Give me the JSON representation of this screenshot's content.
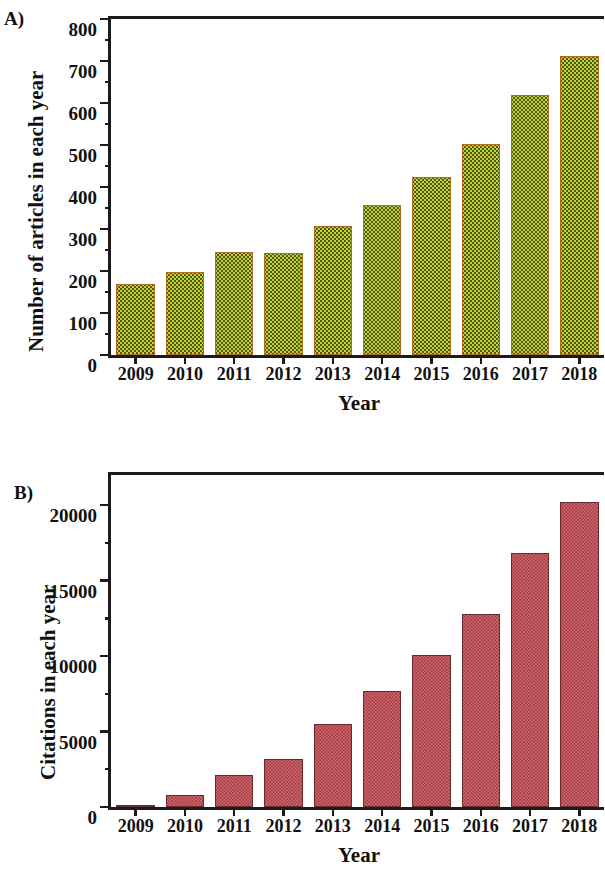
{
  "figure": {
    "panel_a_letter": "A)",
    "panel_b_letter": "B)"
  },
  "chart_data": [
    {
      "panel": "A)",
      "type": "bar",
      "title": "",
      "xlabel": "Year",
      "ylabel": "Number of articles in each year",
      "categories": [
        "2009",
        "2010",
        "2011",
        "2012",
        "2013",
        "2014",
        "2015",
        "2016",
        "2017",
        "2018"
      ],
      "values": [
        170,
        198,
        245,
        243,
        307,
        357,
        425,
        502,
        620,
        712
      ],
      "ylim": [
        0,
        800
      ],
      "ytick_labels": [
        "0",
        "100",
        "200",
        "300",
        "400",
        "500",
        "600",
        "700",
        "800"
      ],
      "ytick_values": [
        0,
        100,
        200,
        300,
        400,
        500,
        600,
        700,
        800
      ],
      "yminor_values": [
        50,
        150,
        250,
        350,
        450,
        550,
        650,
        750
      ],
      "grid": false,
      "legend": false,
      "bar_fill_color": "#c3d338",
      "bar_edge_color": "#b06a1f",
      "bar_pattern": "dotted"
    },
    {
      "panel": "B)",
      "type": "bar",
      "title": "",
      "xlabel": "Year",
      "ylabel": "Citations in each year",
      "categories": [
        "2009",
        "2010",
        "2011",
        "2012",
        "2013",
        "2014",
        "2015",
        "2016",
        "2017",
        "2018"
      ],
      "values": [
        120,
        800,
        2100,
        3200,
        5500,
        7700,
        10100,
        12800,
        16800,
        20200
      ],
      "ylim": [
        0,
        22000
      ],
      "ytick_labels": [
        "0",
        "5000",
        "10000",
        "15000",
        "20000"
      ],
      "ytick_values": [
        0,
        5000,
        10000,
        15000,
        20000
      ],
      "yminor_values": [
        2500,
        7500,
        12500,
        17500
      ],
      "grid": false,
      "legend": false,
      "bar_fill_color": "#cb6e73",
      "bar_edge_color": "#6a2a2c",
      "bar_pattern": "dotted"
    }
  ]
}
